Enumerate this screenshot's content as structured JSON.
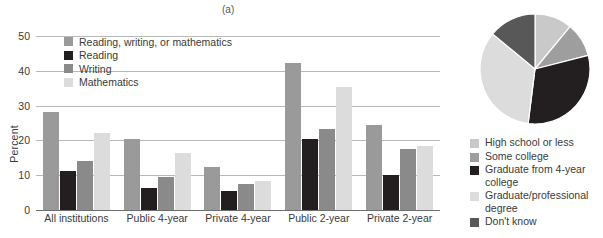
{
  "panels": {
    "a_label": "(a)",
    "b_label": "(b)"
  },
  "chart_data": [
    {
      "type": "bar",
      "title": "(a)",
      "xlabel": "",
      "ylabel": "Percent",
      "ylim": [
        0,
        50
      ],
      "yticks": [
        0,
        10,
        20,
        30,
        40,
        50
      ],
      "grid": true,
      "legend_position": "top-left",
      "categories": [
        "All institutions",
        "Public 4-year",
        "Private 4-year",
        "Public 2-year",
        "Private 2-year"
      ],
      "series": [
        {
          "name": "Reading, writing, or mathematics",
          "color": "#9a9a9a",
          "values": [
            28.3,
            20.3,
            12.4,
            42.3,
            24.5
          ]
        },
        {
          "name": "Reading",
          "color": "#231f20",
          "values": [
            11.3,
            6.4,
            5.5,
            20.4,
            10.0
          ]
        },
        {
          "name": "Writing",
          "color": "#8a8a8a",
          "values": [
            14.2,
            9.4,
            7.5,
            23.3,
            17.5
          ]
        },
        {
          "name": "Mathematics",
          "color": "#dcdcdc",
          "values": [
            22.1,
            16.3,
            8.4,
            35.3,
            18.3
          ]
        }
      ]
    },
    {
      "type": "pie",
      "title": "(b)",
      "legend_position": "bottom",
      "labels": [
        "High school or less",
        "Some college",
        "Graduate from 4-year college",
        "Graduate/professional degree",
        "Don't know"
      ],
      "values": [
        11,
        10,
        31,
        34,
        14
      ],
      "colors": [
        "#c9c9c9",
        "#9e9e9e",
        "#231f20",
        "#dcdcdc",
        "#585858"
      ],
      "start_angle": 0
    }
  ]
}
